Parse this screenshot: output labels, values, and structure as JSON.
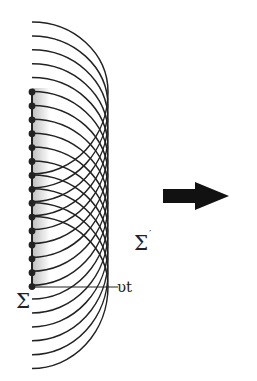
{
  "figure": {
    "labels": {
      "source_front": "Σ",
      "new_front": "Σ",
      "new_front_prime": "′",
      "displacement": "υt"
    },
    "sources": {
      "count": 15,
      "x": 32,
      "y_start": 92,
      "spacing": 13.9
    },
    "wavelet": {
      "rx": 76,
      "ry_top": 70,
      "ry_bottom": 82
    },
    "colors": {
      "ink": "#222222",
      "band_start": "#bdbdbd",
      "band_end": "#ffffff",
      "arrow": "#111111"
    },
    "arrow": {
      "direction": "right"
    }
  }
}
